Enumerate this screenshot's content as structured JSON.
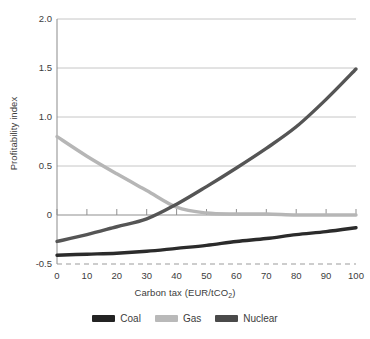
{
  "chart_data": {
    "type": "line",
    "title": "",
    "xlabel": "Carbon tax (EUR/tCO2)",
    "xlabel_main": "Carbon tax (EUR/tCO",
    "xlabel_sub": "2",
    "xlabel_close": ")",
    "ylabel": "Profitability index",
    "xlim": [
      0,
      100
    ],
    "ylim": [
      -0.5,
      2.0
    ],
    "grid": true,
    "grid_y_values": [
      2.0,
      1.5,
      1.0,
      0.5,
      0,
      -0.5
    ],
    "legend_position": "bottom",
    "x": [
      0,
      10,
      20,
      30,
      40,
      50,
      60,
      70,
      80,
      90,
      100
    ],
    "xticks": [
      "0",
      "10",
      "20",
      "30",
      "40",
      "50",
      "60",
      "70",
      "80",
      "90",
      "100"
    ],
    "yticks": [
      "2.0",
      "1.5",
      "1.0",
      "0.5",
      "0",
      "-0.5"
    ],
    "series": [
      {
        "name": "Coal",
        "color": "#2b2b2b",
        "values": [
          -0.41,
          -0.4,
          -0.39,
          -0.37,
          -0.34,
          -0.31,
          -0.27,
          -0.24,
          -0.2,
          -0.17,
          -0.13
        ]
      },
      {
        "name": "Gas",
        "color": "#b6b6b6",
        "values": [
          0.8,
          0.6,
          0.42,
          0.25,
          0.08,
          0.02,
          0.01,
          0.01,
          0.0,
          0.0,
          0.0
        ]
      },
      {
        "name": "Nuclear",
        "color": "#555555",
        "values": [
          -0.27,
          -0.2,
          -0.12,
          -0.04,
          0.11,
          0.29,
          0.48,
          0.68,
          0.9,
          1.18,
          1.49
        ]
      }
    ]
  },
  "legend": {
    "items": [
      {
        "label": "Coal",
        "color": "#232323"
      },
      {
        "label": "Gas",
        "color": "#b9b9b9"
      },
      {
        "label": "Nuclear",
        "color": "#4a4a4a"
      }
    ]
  },
  "axes": {
    "y_title": "Profitability index",
    "x_title_main": "Carbon tax (EUR/tCO",
    "x_title_sub": "2",
    "x_title_close": ")"
  }
}
